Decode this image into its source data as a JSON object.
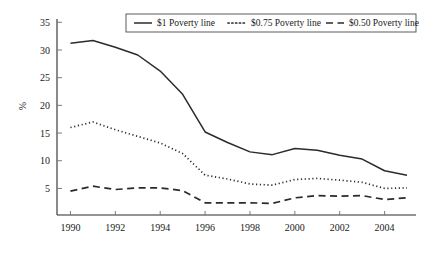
{
  "chart_data": {
    "type": "line",
    "title": "",
    "subtitle": "",
    "xlabel": "",
    "ylabel": "%",
    "x": [
      1990,
      1991,
      1992,
      1993,
      1994,
      1995,
      1996,
      1997,
      1998,
      1999,
      2000,
      2001,
      2002,
      2003,
      2004,
      2005
    ],
    "xtick_labels": [
      "1990",
      "1992",
      "1994",
      "1996",
      "1998",
      "2000",
      "2002",
      "2004"
    ],
    "xticks": [
      1990,
      1992,
      1994,
      1996,
      1998,
      2000,
      2002,
      2004
    ],
    "xlim": [
      1989.4,
      2005.4
    ],
    "ytick_labels": [
      "5",
      "10",
      "15",
      "20",
      "25",
      "30",
      "35"
    ],
    "yticks": [
      5,
      10,
      15,
      20,
      25,
      30,
      35
    ],
    "ylim": [
      0.2,
      35.6
    ],
    "grid": false,
    "legend_position": "top-center",
    "series": [
      {
        "name": "$1 Poverty line",
        "style": "solid",
        "color": "#2b2b2b",
        "values": [
          31.2,
          31.7,
          30.5,
          29.1,
          26.2,
          22.0,
          15.2,
          13.3,
          11.6,
          11.1,
          12.2,
          11.9,
          11.0,
          10.3,
          8.2,
          7.4
        ]
      },
      {
        "name": "$0.75 Poverty line",
        "style": "dotted",
        "color": "#2b2b2b",
        "values": [
          16.0,
          17.0,
          15.6,
          14.4,
          13.2,
          11.3,
          7.4,
          6.7,
          5.8,
          5.6,
          6.6,
          6.8,
          6.5,
          6.1,
          5.0,
          5.1
        ]
      },
      {
        "name": "$0.50 Poverty line",
        "style": "dashed",
        "color": "#2b2b2b",
        "values": [
          4.5,
          5.4,
          4.8,
          5.1,
          5.1,
          4.6,
          2.4,
          2.4,
          2.4,
          2.3,
          3.3,
          3.7,
          3.6,
          3.7,
          3.0,
          3.3
        ]
      }
    ]
  },
  "legend": {
    "entries": [
      {
        "label": "$1 Poverty line",
        "style": "solid"
      },
      {
        "label": "$0.75 Poverty line",
        "style": "dotted"
      },
      {
        "label": "$0.50 Poverty line",
        "style": "dashed"
      }
    ]
  },
  "axes": {
    "y_axis_title": "%"
  }
}
